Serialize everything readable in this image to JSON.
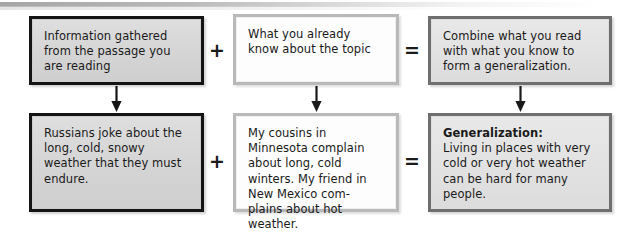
{
  "diagram": {
    "operators": {
      "plus": "+",
      "equals": "="
    },
    "rows": [
      {
        "id": "row-1",
        "name": "concept-row",
        "cells": [
          {
            "id": "r1c1",
            "style": "dark",
            "text": "Information gathered from the passage you are reading"
          },
          {
            "id": "r1c2",
            "style": "light",
            "text": "What you already know about the topic"
          },
          {
            "id": "r1c3",
            "style": "mid",
            "text": "Combine what you read with what you know to form a generalization."
          }
        ]
      },
      {
        "id": "row-2",
        "name": "example-row",
        "cells": [
          {
            "id": "r2c1",
            "style": "dark",
            "text": "Russians joke about the long, cold, snowy weather that they must endure."
          },
          {
            "id": "r2c2",
            "style": "light",
            "text": "My cousins in Minnesota complain about long, cold winters. My friend in New Mexico com-plains about hot weather."
          },
          {
            "id": "r2c3",
            "style": "mid",
            "lead": "Generalization:",
            "text": "Living in places with very cold or very hot weather can be hard for many people."
          }
        ]
      }
    ],
    "arrows": [
      {
        "id": "arrow-c1",
        "name": "down-arrow-column-1"
      },
      {
        "id": "arrow-c2",
        "name": "down-arrow-column-2"
      },
      {
        "id": "arrow-c3",
        "name": "down-arrow-column-3"
      }
    ],
    "colors": {
      "dark_border": "#141414",
      "dark_fill": "#d9d9d9",
      "light_border": "#b9b9b9",
      "light_fill": "#fdfdfd",
      "mid_border": "#6f6f6f",
      "mid_fill": "#e2e2e2",
      "text": "#1a1a1a",
      "page_background": "#ffffff"
    }
  }
}
